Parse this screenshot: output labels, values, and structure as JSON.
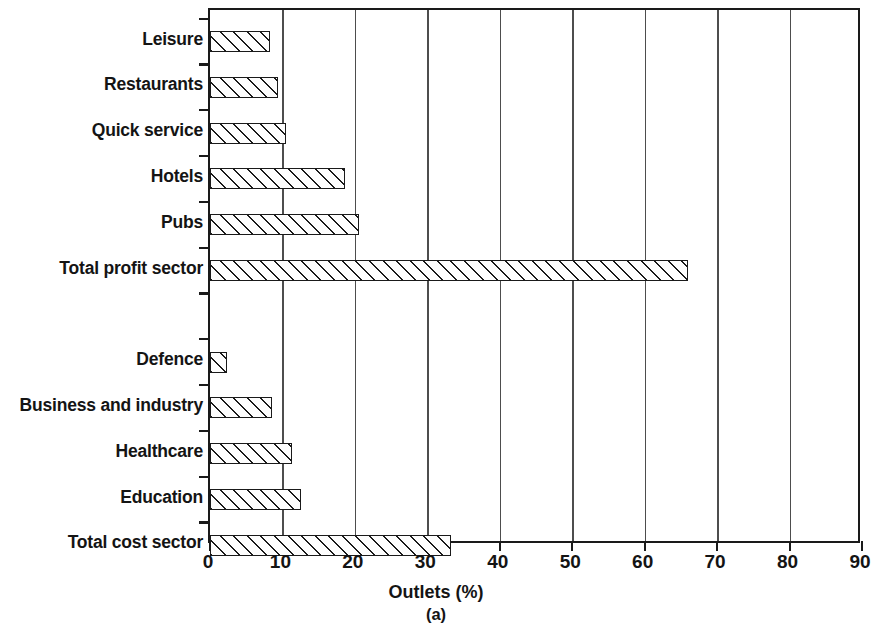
{
  "chart_data": {
    "type": "bar",
    "orientation": "horizontal",
    "title": "",
    "xlabel": "Outlets (%)",
    "ylabel": "",
    "caption": "(a)",
    "xlim": [
      0,
      90
    ],
    "xticks": [
      0,
      10,
      20,
      30,
      40,
      50,
      60,
      70,
      80,
      90
    ],
    "xtick_labels": [
      "0",
      "10",
      "20",
      "30",
      "40",
      "50",
      "60",
      "70",
      "80",
      "90"
    ],
    "grid": "vertical",
    "legend": null,
    "bar_style": "hatched-diagonal",
    "categories": [
      "Leisure",
      "Restaurants",
      "Quick service",
      "Hotels",
      "Pubs",
      "Total profit sector",
      "",
      "Defence",
      "Business and industry",
      "Healthcare",
      "Education",
      "Total cost sector"
    ],
    "values": [
      8.3,
      9.4,
      10.5,
      18.6,
      20.6,
      66.0,
      null,
      2.3,
      8.6,
      11.3,
      12.5,
      33.2
    ],
    "groups": [
      {
        "name": "Profit sector",
        "items": [
          {
            "label": "Leisure",
            "value": 8.3
          },
          {
            "label": "Restaurants",
            "value": 9.4
          },
          {
            "label": "Quick service",
            "value": 10.5
          },
          {
            "label": "Hotels",
            "value": 18.6
          },
          {
            "label": "Pubs",
            "value": 20.6
          },
          {
            "label": "Total profit sector",
            "value": 66.0
          }
        ]
      },
      {
        "name": "Cost sector",
        "items": [
          {
            "label": "Defence",
            "value": 2.3
          },
          {
            "label": "Business and industry",
            "value": 8.6
          },
          {
            "label": "Healthcare",
            "value": 11.3
          },
          {
            "label": "Education",
            "value": 12.5
          },
          {
            "label": "Total cost sector",
            "value": 33.2
          }
        ]
      }
    ]
  },
  "axis": {
    "x_title": "Outlets (%)",
    "caption": "(a)"
  },
  "colors": {
    "axis": "#1a1a1a",
    "grid": "#4d4d4d",
    "bar_edge": "#1a1a1a",
    "bar_fill": "#fdfdfd",
    "text": "#141414",
    "background": "#ffffff"
  }
}
